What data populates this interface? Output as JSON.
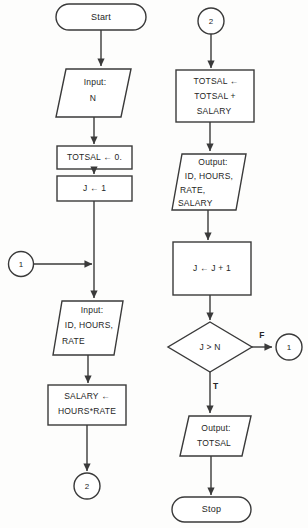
{
  "diagram": {
    "type": "flowchart",
    "stroke_color": "#3a3a3a",
    "fill_color": "#ffffff",
    "background_color": "#fdfdfc"
  },
  "left_column": {
    "start_terminal": {
      "label": "Start",
      "shape": "terminal"
    },
    "input_n": {
      "line1": "Input:",
      "line2": "N",
      "shape": "parallelogram"
    },
    "totsal_init": {
      "label": "TOTSAL ← 0.",
      "shape": "process"
    },
    "j_init": {
      "label": "J ← 1",
      "shape": "process"
    },
    "connector_1_in": {
      "label": "1",
      "shape": "connector"
    },
    "input_record": {
      "line1": "Input:",
      "line2": "ID, HOURS,",
      "line3": "RATE",
      "shape": "parallelogram"
    },
    "salary_calc": {
      "line1": "SALARY ←",
      "line2": "HOURS*RATE",
      "shape": "process"
    },
    "connector_2_out": {
      "label": "2",
      "shape": "connector"
    }
  },
  "right_column": {
    "connector_2_in": {
      "label": "2",
      "shape": "connector"
    },
    "totsal_accumulate": {
      "line1": "TOTSAL ←",
      "line2": "TOTSAL +",
      "line3": "SALARY",
      "shape": "process"
    },
    "output_record": {
      "line1": "Output:",
      "line2": "ID, HOURS,",
      "line3": "RATE,",
      "line4": "SALARY",
      "shape": "parallelogram"
    },
    "j_increment": {
      "label": "J ← J + 1",
      "shape": "process"
    },
    "decision": {
      "label": "J > N",
      "shape": "diamond",
      "true_label": "T",
      "false_label": "F"
    },
    "connector_1_out": {
      "label": "1",
      "shape": "connector"
    },
    "output_totsal": {
      "line1": "Output:",
      "line2": "TOTSAL",
      "shape": "parallelogram"
    },
    "stop_terminal": {
      "label": "Stop",
      "shape": "terminal"
    }
  }
}
